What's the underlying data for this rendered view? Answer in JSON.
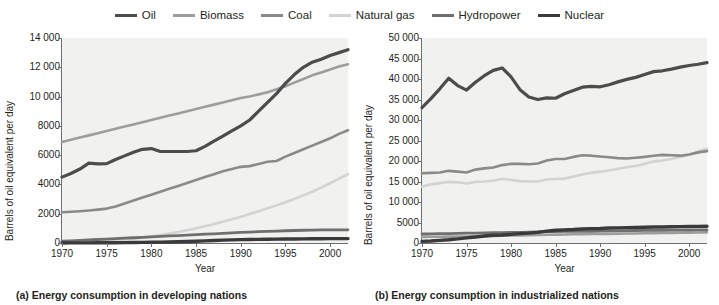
{
  "legend": {
    "items": [
      {
        "label": "Oil",
        "color": "#4c4c4c",
        "width": 3.2
      },
      {
        "label": "Biomass",
        "color": "#9d9d9d",
        "width": 2.6
      },
      {
        "label": "Coal",
        "color": "#8a8a8a",
        "width": 2.6
      },
      {
        "label": "Natural gas",
        "color": "#d3d3d3",
        "width": 2.6
      },
      {
        "label": "Hydropower",
        "color": "#6f6f6f",
        "width": 2.8
      },
      {
        "label": "Nuclear",
        "color": "#3a3a3a",
        "width": 3.4
      }
    ]
  },
  "panels": {
    "a": {
      "caption": "(a) Energy consumption in developing nations",
      "ylabel": "Barrels of oil equivalent per day",
      "xlabel": "Year",
      "yticks": [
        "0",
        "2000",
        "4000",
        "6000",
        "8000",
        "10 000",
        "12 000",
        "14 000"
      ],
      "xticks": [
        "1970",
        "1975",
        "1980",
        "1985",
        "1990",
        "1995",
        "2000"
      ]
    },
    "b": {
      "caption": "(b) Energy consumption in industrialized nations",
      "ylabel": "Barrels of oil equivalent per day",
      "xlabel": "Year",
      "yticks": [
        "0",
        "5000",
        "10 000",
        "15 000",
        "20 000",
        "25 000",
        "30 000",
        "35 000",
        "40 000",
        "45 000",
        "50 000"
      ],
      "xticks": [
        "1970",
        "1975",
        "1980",
        "1985",
        "1990",
        "1995",
        "2000"
      ]
    }
  },
  "chart_data": [
    {
      "panel": "a",
      "type": "line",
      "title": "(a) Energy consumption in developing nations",
      "xlabel": "Year",
      "ylabel": "Barrels of oil equivalent per day",
      "xlim": [
        1970,
        2002
      ],
      "ylim": [
        0,
        14000
      ],
      "ytick_step": 2000,
      "xtick_step": 5,
      "grid": false,
      "legend_position": "top-center",
      "x": [
        1970,
        1971,
        1972,
        1973,
        1974,
        1975,
        1976,
        1977,
        1978,
        1979,
        1980,
        1981,
        1982,
        1983,
        1984,
        1985,
        1986,
        1987,
        1988,
        1989,
        1990,
        1991,
        1992,
        1993,
        1994,
        1995,
        1996,
        1997,
        1998,
        1999,
        2000,
        2001,
        2002
      ],
      "series": [
        {
          "name": "Oil",
          "color": "#4c4c4c",
          "values": [
            4500,
            4750,
            5050,
            5450,
            5400,
            5420,
            5700,
            5950,
            6200,
            6400,
            6450,
            6250,
            6250,
            6250,
            6250,
            6300,
            6600,
            6950,
            7300,
            7650,
            8000,
            8400,
            9000,
            9600,
            10200,
            10900,
            11500,
            12000,
            12350,
            12550,
            12800,
            13000,
            13200
          ]
        },
        {
          "name": "Biomass",
          "color": "#9d9d9d",
          "values": [
            6900,
            7050,
            7200,
            7350,
            7500,
            7650,
            7800,
            7950,
            8100,
            8250,
            8400,
            8550,
            8700,
            8850,
            9000,
            9150,
            9300,
            9450,
            9600,
            9750,
            9900,
            10000,
            10150,
            10300,
            10500,
            10700,
            10950,
            11200,
            11450,
            11650,
            11850,
            12050,
            12200
          ]
        },
        {
          "name": "Coal",
          "color": "#8a8a8a",
          "values": [
            2100,
            2130,
            2170,
            2220,
            2280,
            2350,
            2500,
            2700,
            2900,
            3100,
            3300,
            3500,
            3700,
            3900,
            4100,
            4300,
            4500,
            4700,
            4900,
            5050,
            5200,
            5250,
            5400,
            5550,
            5600,
            5900,
            6150,
            6400,
            6650,
            6900,
            7150,
            7450,
            7700
          ]
        },
        {
          "name": "Natural gas",
          "color": "#d3d3d3",
          "values": [
            50,
            60,
            75,
            95,
            120,
            150,
            190,
            240,
            300,
            370,
            450,
            540,
            640,
            750,
            870,
            1000,
            1140,
            1290,
            1450,
            1620,
            1800,
            1980,
            2170,
            2370,
            2570,
            2780,
            3000,
            3250,
            3500,
            3780,
            4080,
            4400,
            4700
          ]
        },
        {
          "name": "Hydropower",
          "color": "#6f6f6f",
          "values": [
            120,
            150,
            180,
            210,
            240,
            270,
            300,
            330,
            360,
            390,
            420,
            450,
            480,
            510,
            540,
            570,
            600,
            630,
            660,
            690,
            720,
            745,
            770,
            795,
            815,
            835,
            855,
            870,
            880,
            890,
            895,
            900,
            900
          ]
        },
        {
          "name": "Nuclear",
          "color": "#3a3a3a",
          "values": [
            5,
            6,
            8,
            10,
            13,
            17,
            22,
            28,
            35,
            43,
            52,
            62,
            73,
            85,
            100,
            120,
            145,
            170,
            195,
            215,
            230,
            240,
            250,
            258,
            265,
            272,
            278,
            284,
            289,
            293,
            297,
            300,
            302
          ]
        }
      ]
    },
    {
      "panel": "b",
      "type": "line",
      "title": "(b) Energy consumption in industrialized nations",
      "xlabel": "Year",
      "ylabel": "Barrels of oil equivalent per day",
      "xlim": [
        1970,
        2002
      ],
      "ylim": [
        0,
        50000
      ],
      "ytick_step": 5000,
      "xtick_step": 5,
      "grid": false,
      "legend_position": "top-center",
      "x": [
        1970,
        1971,
        1972,
        1973,
        1974,
        1975,
        1976,
        1977,
        1978,
        1979,
        1980,
        1981,
        1982,
        1983,
        1984,
        1985,
        1986,
        1987,
        1988,
        1989,
        1990,
        1991,
        1992,
        1993,
        1994,
        1995,
        1996,
        1997,
        1998,
        1999,
        2000,
        2001,
        2002
      ],
      "series": [
        {
          "name": "Oil",
          "color": "#4c4c4c",
          "values": [
            33000,
            35200,
            37600,
            40200,
            38400,
            37300,
            39200,
            40800,
            42100,
            42700,
            40500,
            37400,
            35600,
            35000,
            35400,
            35300,
            36400,
            37200,
            38000,
            38200,
            38100,
            38600,
            39300,
            39900,
            40400,
            41100,
            41800,
            42000,
            42400,
            42900,
            43300,
            43600,
            44000
          ]
        },
        {
          "name": "Coal",
          "color": "#8a8a8a",
          "values": [
            17000,
            17100,
            17200,
            17600,
            17400,
            17200,
            17900,
            18200,
            18400,
            19000,
            19300,
            19300,
            19200,
            19400,
            20100,
            20500,
            20500,
            21000,
            21400,
            21300,
            21100,
            20900,
            20700,
            20600,
            20800,
            21000,
            21300,
            21500,
            21400,
            21300,
            21600,
            22100,
            22400
          ]
        },
        {
          "name": "Natural gas",
          "color": "#d3d3d3",
          "values": [
            13800,
            14300,
            14600,
            14900,
            14800,
            14500,
            14900,
            15000,
            15200,
            15600,
            15400,
            15100,
            15000,
            15000,
            15500,
            15600,
            15700,
            16200,
            16700,
            17100,
            17400,
            17700,
            18100,
            18500,
            18800,
            19300,
            19900,
            20100,
            20500,
            21000,
            21500,
            22300,
            23000
          ]
        },
        {
          "name": "Hydropower",
          "color": "#6f6f6f",
          "values": [
            2200,
            2250,
            2280,
            2300,
            2350,
            2400,
            2420,
            2450,
            2500,
            2520,
            2560,
            2600,
            2640,
            2700,
            2750,
            2800,
            2830,
            2860,
            2880,
            2850,
            2900,
            2950,
            2950,
            3000,
            3050,
            3080,
            3100,
            3100,
            3120,
            3150,
            3150,
            3180,
            3200
          ]
        },
        {
          "name": "Nuclear",
          "color": "#3a3a3a",
          "values": [
            400,
            500,
            650,
            800,
            1000,
            1250,
            1450,
            1700,
            1900,
            1950,
            2100,
            2300,
            2400,
            2600,
            2900,
            3100,
            3200,
            3300,
            3450,
            3500,
            3550,
            3650,
            3700,
            3750,
            3800,
            3850,
            3900,
            3900,
            3950,
            4000,
            4020,
            4050,
            4080
          ]
        },
        {
          "name": "Biomass",
          "color": "#9d9d9d",
          "values": [
            1500,
            1520,
            1540,
            1560,
            1580,
            1600,
            1640,
            1680,
            1720,
            1780,
            1820,
            1860,
            1900,
            1950,
            2000,
            2050,
            2080,
            2120,
            2150,
            2180,
            2200,
            2230,
            2260,
            2300,
            2330,
            2360,
            2400,
            2430,
            2460,
            2500,
            2530,
            2560,
            2600
          ]
        }
      ]
    }
  ]
}
